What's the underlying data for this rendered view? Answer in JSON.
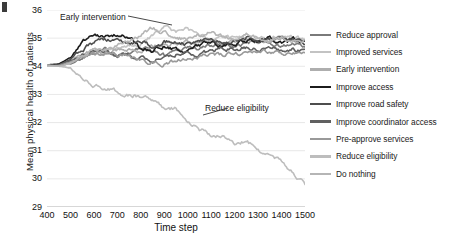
{
  "chart_data": {
    "type": "line",
    "title": "",
    "xlabel": "Time step",
    "ylabel": "Mean physical health of patients",
    "xlim": [
      400,
      1500
    ],
    "ylim": [
      29,
      36
    ],
    "xticks": [
      400,
      500,
      600,
      700,
      800,
      900,
      1000,
      1100,
      1200,
      1300,
      1400,
      1500
    ],
    "yticks": [
      29,
      30,
      31,
      32,
      33,
      34,
      35,
      36
    ],
    "grid": "horizontal",
    "legend_position": "right",
    "annotations": [
      {
        "text": "Early intervention",
        "x": 520,
        "y": 35.8
      },
      {
        "text": "Reduce eligibility",
        "x": 1080,
        "y": 32.55
      }
    ],
    "series": [
      {
        "name": "Reduce approval",
        "color": "#7a7a7a",
        "x": [
          400,
          450,
          500,
          550,
          600,
          650,
          700,
          750,
          800,
          850,
          900,
          950,
          1000,
          1050,
          1100,
          1150,
          1200,
          1250,
          1300,
          1350,
          1400,
          1450,
          1500
        ],
        "values": [
          34.05,
          34.02,
          34.1,
          34.3,
          34.55,
          34.6,
          34.45,
          34.5,
          34.62,
          34.55,
          34.4,
          34.58,
          34.7,
          34.62,
          34.75,
          34.85,
          34.7,
          34.8,
          34.95,
          34.85,
          34.7,
          34.78,
          34.65
        ]
      },
      {
        "name": "Improved services",
        "color": "#c3c3c3",
        "x": [
          400,
          450,
          500,
          550,
          600,
          650,
          700,
          750,
          800,
          850,
          900,
          950,
          1000,
          1050,
          1100,
          1150,
          1200,
          1250,
          1300,
          1350,
          1400,
          1450,
          1500
        ],
        "values": [
          34.02,
          34.05,
          34.15,
          34.4,
          34.6,
          34.55,
          34.65,
          34.75,
          34.8,
          35.1,
          35.35,
          35.2,
          35.3,
          35.05,
          34.9,
          35.0,
          35.1,
          34.95,
          35.05,
          34.95,
          35.1,
          35.0,
          34.9
        ]
      },
      {
        "name": "Early intervention",
        "color": "#aeaeae",
        "x": [
          400,
          450,
          500,
          550,
          600,
          650,
          700,
          750,
          800,
          850,
          900,
          950,
          1000,
          1050,
          1100,
          1150,
          1200,
          1250,
          1300,
          1350,
          1400,
          1450,
          1500
        ],
        "values": [
          34.0,
          34.04,
          34.2,
          34.45,
          34.5,
          34.42,
          34.55,
          34.6,
          34.52,
          34.7,
          34.85,
          34.75,
          34.9,
          34.85,
          34.95,
          34.8,
          34.9,
          35.0,
          34.85,
          34.95,
          35.05,
          34.9,
          34.95
        ]
      },
      {
        "name": "Improve access",
        "color": "#1c1c1c",
        "x": [
          400,
          450,
          500,
          550,
          600,
          650,
          700,
          750,
          800,
          850,
          900,
          950,
          1000,
          1050,
          1100,
          1150,
          1200,
          1250,
          1300,
          1350,
          1400,
          1450,
          1500
        ],
        "values": [
          34.05,
          34.08,
          34.3,
          34.85,
          35.1,
          35.05,
          35.15,
          35.1,
          34.6,
          34.55,
          34.7,
          34.6,
          34.5,
          34.75,
          34.85,
          34.7,
          34.8,
          34.95,
          34.9,
          35.0,
          34.85,
          34.95,
          34.8
        ]
      },
      {
        "name": "Improve road safety",
        "color": "#4e4e4e",
        "x": [
          400,
          450,
          500,
          550,
          600,
          650,
          700,
          750,
          800,
          850,
          900,
          950,
          1000,
          1050,
          1100,
          1150,
          1200,
          1250,
          1300,
          1350,
          1400,
          1450,
          1500
        ],
        "values": [
          34.0,
          34.03,
          34.25,
          34.6,
          34.85,
          34.9,
          34.95,
          34.8,
          34.9,
          34.7,
          34.85,
          34.9,
          34.75,
          34.9,
          35.0,
          34.85,
          34.9,
          35.05,
          34.95,
          34.9,
          35.0,
          34.9,
          34.85
        ]
      },
      {
        "name": "Improve coordinator access",
        "color": "#606060",
        "x": [
          400,
          450,
          500,
          550,
          600,
          650,
          700,
          750,
          800,
          850,
          900,
          950,
          1000,
          1050,
          1100,
          1150,
          1200,
          1250,
          1300,
          1350,
          1400,
          1450,
          1500
        ],
        "values": [
          34.02,
          34.05,
          34.2,
          34.4,
          34.5,
          34.45,
          34.35,
          34.4,
          34.3,
          34.2,
          34.35,
          34.45,
          34.5,
          34.4,
          34.55,
          34.65,
          34.6,
          34.7,
          34.6,
          34.65,
          34.55,
          34.6,
          34.5
        ]
      },
      {
        "name": "Pre-approve services",
        "color": "#999999",
        "x": [
          400,
          450,
          500,
          550,
          600,
          650,
          700,
          750,
          800,
          850,
          900,
          950,
          1000,
          1050,
          1100,
          1150,
          1200,
          1250,
          1300,
          1350,
          1400,
          1450,
          1500
        ],
        "values": [
          34.0,
          34.02,
          34.15,
          34.3,
          34.45,
          34.5,
          34.4,
          34.35,
          34.25,
          34.15,
          34.1,
          34.2,
          34.35,
          34.3,
          34.45,
          34.4,
          34.5,
          34.45,
          34.55,
          34.5,
          34.45,
          34.5,
          34.4
        ]
      },
      {
        "name": "Reduce eligibility",
        "color": "#bdbdbd",
        "x": [
          400,
          450,
          500,
          550,
          600,
          650,
          700,
          750,
          800,
          850,
          900,
          950,
          1000,
          1050,
          1100,
          1150,
          1200,
          1250,
          1300,
          1350,
          1400,
          1450,
          1500
        ],
        "values": [
          34.0,
          34.0,
          33.95,
          33.6,
          33.35,
          33.2,
          33.1,
          32.95,
          32.95,
          32.85,
          32.55,
          32.5,
          32.0,
          31.75,
          31.55,
          31.5,
          31.25,
          31.4,
          31.0,
          30.75,
          30.6,
          30.25,
          29.8
        ]
      },
      {
        "name": "Do nothing",
        "color": "#b5b5b5",
        "x": [
          400,
          450,
          500,
          550,
          600,
          650,
          700,
          750,
          800,
          850,
          900,
          950,
          1000,
          1050,
          1100,
          1150,
          1200,
          1250,
          1300,
          1350,
          1400,
          1450,
          1500
        ],
        "values": [
          34.05,
          34.0,
          34.1,
          34.35,
          34.55,
          34.6,
          34.7,
          34.9,
          35.1,
          35.35,
          35.2,
          35.05,
          34.95,
          35.1,
          35.2,
          35.05,
          34.95,
          35.1,
          35.0,
          34.9,
          35.0,
          34.85,
          34.9
        ]
      }
    ]
  }
}
